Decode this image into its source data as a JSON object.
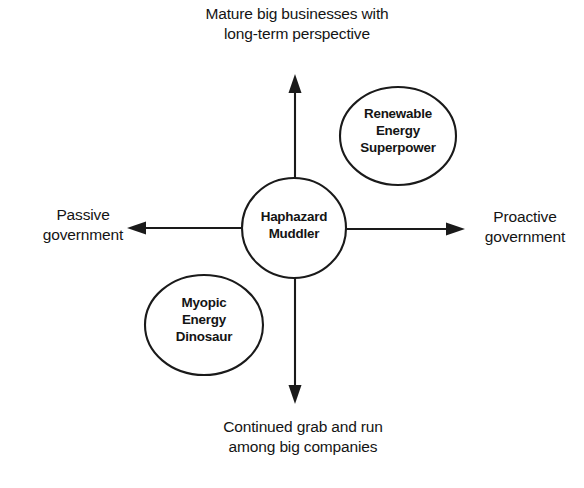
{
  "diagram": {
    "type": "two-axis-scenario-matrix",
    "title_present": false,
    "background_color": "#ffffff",
    "line_color": "#1a1a1a",
    "text_color": "#141414",
    "axes": {
      "vertical": {
        "top_label": "Mature big businesses with\nlong-term perspective",
        "bottom_label": "Continued grab and run\namong big companies"
      },
      "horizontal": {
        "left_label": "Passive\ngovernment",
        "right_label": "Proactive\ngovernment"
      }
    },
    "nodes": [
      {
        "id": "center",
        "label": "Haphazard\nMuddler",
        "cx": 294,
        "cy": 228,
        "rx": 52,
        "ry": 50
      },
      {
        "id": "top-right",
        "label": "Renewable\nEnergy\nSuperpower",
        "cx": 398,
        "cy": 136,
        "rx": 58,
        "ry": 49
      },
      {
        "id": "bottom-left",
        "label": "Myopic\nEnergy\nDinosaur",
        "cx": 204,
        "cy": 325,
        "rx": 59,
        "ry": 50
      }
    ]
  }
}
